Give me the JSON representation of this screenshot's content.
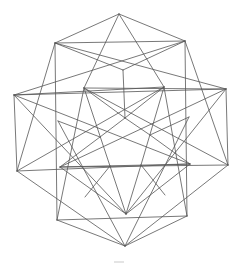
{
  "diagram": {
    "title": "",
    "stroke_color": "#555555",
    "background": "#ffffff",
    "vertices": {
      "T": [
        119,
        14
      ],
      "SQ_TL": [
        55,
        43
      ],
      "SQ_TR": [
        185,
        41
      ],
      "L": [
        14,
        95
      ],
      "R": [
        226,
        89
      ],
      "BL": [
        17,
        171
      ],
      "BR": [
        228,
        165
      ],
      "SQ_BL": [
        57,
        220
      ],
      "SQ_BR": [
        187,
        216
      ],
      "B": [
        125,
        246
      ],
      "I_T": [
        123,
        70
      ],
      "I_UL": [
        84,
        88
      ],
      "I_UR": [
        164,
        87
      ],
      "C": [
        125,
        118
      ],
      "I_ML": [
        100,
        137
      ],
      "I_MR": [
        150,
        135
      ],
      "I_L": [
        58,
        121
      ],
      "I_R": [
        189,
        117
      ],
      "I_LL": [
        60,
        167
      ],
      "I_LR": [
        190,
        164
      ],
      "I_BL": [
        110,
        166
      ],
      "I_BR": [
        141,
        165
      ],
      "I_B": [
        126,
        214
      ],
      "P_BL": [
        85,
        197
      ],
      "P_BR": [
        165,
        195
      ],
      "SQ_LM": [
        56,
        90
      ],
      "SQ_RM": [
        188,
        88
      ]
    },
    "edges": [
      [
        "T",
        "SQ_TL"
      ],
      [
        "T",
        "SQ_TR"
      ],
      [
        "T",
        "I_UL"
      ],
      [
        "T",
        "I_UR"
      ],
      [
        "SQ_TL",
        "SQ_TR"
      ],
      [
        "SQ_TL",
        "SQ_BL"
      ],
      [
        "SQ_TR",
        "SQ_BR"
      ],
      [
        "SQ_BL",
        "SQ_BR"
      ],
      [
        "SQ_TL",
        "I_T"
      ],
      [
        "SQ_TR",
        "I_T"
      ],
      [
        "I_T",
        "C"
      ],
      [
        "L",
        "SQ_TR"
      ],
      [
        "L",
        "I_UR"
      ],
      [
        "L",
        "R"
      ],
      [
        "R",
        "SQ_TL"
      ],
      [
        "R",
        "I_UL"
      ],
      [
        "L",
        "BL"
      ],
      [
        "L",
        "I_LR"
      ],
      [
        "L",
        "I_B"
      ],
      [
        "R",
        "BR"
      ],
      [
        "R",
        "I_LL"
      ],
      [
        "R",
        "I_B"
      ],
      [
        "BL",
        "SQ_TL"
      ],
      [
        "BL",
        "I_UR"
      ],
      [
        "BL",
        "B"
      ],
      [
        "BL",
        "I_LR"
      ],
      [
        "BR",
        "SQ_TR"
      ],
      [
        "BR",
        "I_UL"
      ],
      [
        "BR",
        "B"
      ],
      [
        "BR",
        "I_LL"
      ],
      [
        "B",
        "SQ_BL"
      ],
      [
        "B",
        "SQ_BR"
      ],
      [
        "B",
        "I_L"
      ],
      [
        "B",
        "I_R"
      ],
      [
        "I_UL",
        "C"
      ],
      [
        "I_UR",
        "C"
      ],
      [
        "C",
        "I_ML"
      ],
      [
        "C",
        "I_MR"
      ],
      [
        "I_UL",
        "I_BL"
      ],
      [
        "I_UR",
        "I_BR"
      ],
      [
        "I_L",
        "I_ML"
      ],
      [
        "I_R",
        "I_MR"
      ],
      [
        "I_ML",
        "I_LL"
      ],
      [
        "I_MR",
        "I_LR"
      ],
      [
        "I_LL",
        "I_LR"
      ],
      [
        "I_LL",
        "I_B"
      ],
      [
        "I_LR",
        "I_B"
      ],
      [
        "I_BL",
        "I_B"
      ],
      [
        "I_BR",
        "I_B"
      ],
      [
        "I_BL",
        "P_BL"
      ],
      [
        "I_BR",
        "P_BR"
      ],
      [
        "SQ_BL",
        "I_UL"
      ],
      [
        "SQ_BR",
        "I_UR"
      ]
    ],
    "bottom_mark": {
      "x1": 114,
      "y1": 262,
      "x2": 124,
      "y2": 262
    }
  }
}
